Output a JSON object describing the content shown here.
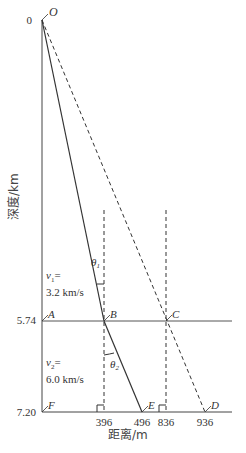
{
  "header_clipped_text": "",
  "axes": {
    "y_label": "深度/km",
    "x_label": "距离/m",
    "y_ticks": [
      {
        "label": "0",
        "value": 0
      },
      {
        "label": "5.74",
        "value": 5.74
      },
      {
        "label": "7.20",
        "value": 7.2
      }
    ],
    "x_ticks": [
      {
        "label": "396",
        "value": 396
      },
      {
        "label": "496",
        "value": 496
      },
      {
        "label": "836",
        "value": 836
      },
      {
        "label": "936",
        "value": 936
      }
    ]
  },
  "points": {
    "O": "O",
    "A": "A",
    "B": "B",
    "C": "C",
    "D": "D",
    "E": "E",
    "F": "F"
  },
  "angles": {
    "theta1": "θ",
    "theta1_sub": "1",
    "theta2": "θ",
    "theta2_sub": "2"
  },
  "layers": [
    {
      "velocity_var": "v",
      "sub": "1",
      "eq": "=",
      "value": "3.2 km/s"
    },
    {
      "velocity_var": "v",
      "sub": "2",
      "eq": "=",
      "value": "6.0 km/s"
    }
  ],
  "colors": {
    "line": "#333333",
    "interface": "#555555"
  }
}
